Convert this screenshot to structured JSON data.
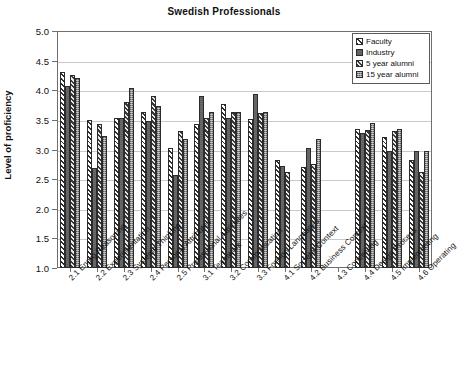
{
  "chart_data": {
    "type": "bar",
    "title": "Swedish Professionals",
    "xlabel": "",
    "ylabel": "Level of proficiency",
    "ylim": [
      1.0,
      5.0
    ],
    "ytick_labels": [
      "5.0",
      "4.5",
      "4.0",
      "3.5",
      "3.0",
      "2.5",
      "2.0",
      "1.5",
      "1.0"
    ],
    "ytick_values": [
      5.0,
      4.5,
      4.0,
      3.5,
      3.0,
      2.5,
      2.0,
      1.5,
      1.0
    ],
    "grid": true,
    "legend_position": "top-right",
    "categories": [
      "2.1 Engrg Reasoning",
      "2.2 Experimentation",
      "2.3 Systems Thinking",
      "2.4 Personal Attributes",
      "2.5 Professional Attributes",
      "3.1 Teamwork",
      "3.2 Communication",
      "3.3 Foreign Languages",
      "4.1 Societal Context",
      "4.2 Business Context",
      "4.3 Conceiving",
      "4.4 Design Process",
      "4.5 Implementing",
      "4.6 Operating"
    ],
    "series": [
      {
        "name": "Faculty",
        "values": [
          4.3,
          3.49,
          3.54,
          3.63,
          3.02,
          3.43,
          3.77,
          3.51,
          2.83,
          2.7,
          null,
          3.35,
          3.21,
          2.82
        ]
      },
      {
        "name": "Industry",
        "values": [
          4.08,
          2.68,
          3.54,
          3.48,
          2.57,
          3.9,
          3.54,
          3.94,
          2.73,
          3.03,
          null,
          3.28,
          2.97,
          2.97
        ]
      },
      {
        "name": "5 year alumni",
        "values": [
          4.25,
          3.43,
          3.8,
          3.9,
          3.31,
          3.54,
          3.63,
          3.62,
          2.62,
          2.75,
          null,
          3.33,
          3.31,
          2.62
        ]
      },
      {
        "name": "15 year alumni",
        "values": [
          4.2,
          3.22,
          4.04,
          3.73,
          3.17,
          3.63,
          3.63,
          3.63,
          null,
          3.17,
          null,
          3.45,
          3.34,
          2.98
        ]
      }
    ]
  },
  "colors": {
    "faculty": "#ffffff",
    "industry": "#6a6a6a",
    "alumni5": "#e8e8e8",
    "alumni15": "#8e8e8e",
    "axis": "#6f6f6f",
    "grid": "#c9c9c9",
    "text": "#111111"
  }
}
